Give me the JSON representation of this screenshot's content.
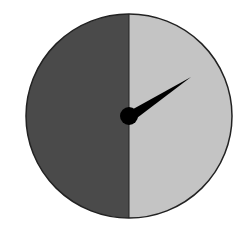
{
  "diagram": {
    "type": "spinner",
    "sections": [
      {
        "name": "left-half",
        "fraction": 0.5,
        "color": "#4a4a4a"
      },
      {
        "name": "right-half",
        "fraction": 0.5,
        "color": "#c4c4c4"
      }
    ],
    "pointer": {
      "angle_deg_from_up_clockwise": 57,
      "color": "#000000"
    },
    "outline_color": "#222222"
  }
}
